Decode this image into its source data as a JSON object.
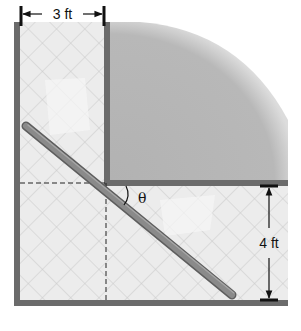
{
  "diagram": {
    "labels": {
      "top_width": "3 ft",
      "right_width": "4 ft",
      "angle": "θ"
    },
    "colors": {
      "wall": "#6b6b6b",
      "floor": "#ececec",
      "tile_lines": "#c9c9c9",
      "room_fill": "#b4b4b4",
      "ladder": "#8a8a8a",
      "ladder_edge": "#5e5e5e",
      "dimension": "#111111"
    }
  }
}
